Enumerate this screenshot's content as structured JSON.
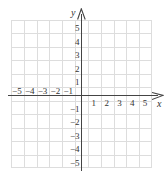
{
  "figure": {
    "kind": "cartesian-coordinate-plane",
    "axis_labels": {
      "x": "x",
      "y": "y"
    },
    "icons": {
      "x_arrow": "arrow-right-icon",
      "y_arrow": "arrow-up-icon"
    },
    "colors": {
      "background": "#ffffff",
      "grid_line": "#dddddd",
      "axis_line": "#444444",
      "label_text": "#333333"
    }
  },
  "chart_data": {
    "type": "scatter",
    "title": "",
    "xlabel": "x",
    "ylabel": "y",
    "xlim": [
      -6,
      6
    ],
    "ylim": [
      -6,
      6
    ],
    "grid": true,
    "legend": null,
    "x_ticks": [
      -5,
      -4,
      -3,
      -2,
      -1,
      1,
      2,
      3,
      4,
      5
    ],
    "y_ticks": [
      5,
      4,
      3,
      2,
      1,
      -1,
      -2,
      -3,
      -4,
      -5
    ],
    "x_tick_labels": [
      "−5",
      "−4",
      "−3",
      "−2",
      "−1",
      "1",
      "2",
      "3",
      "4",
      "5"
    ],
    "y_tick_labels": [
      "5",
      "4",
      "3",
      "2",
      "1",
      "−1",
      "−2",
      "−3",
      "−4",
      "−5"
    ],
    "series": [],
    "annotations": []
  },
  "ticks": {
    "x": [
      {
        "label": "−5",
        "value": -5
      },
      {
        "label": "−4",
        "value": -4
      },
      {
        "label": "−3",
        "value": -3
      },
      {
        "label": "−2",
        "value": -2
      },
      {
        "label": "−1",
        "value": -1
      },
      {
        "label": "1",
        "value": 1
      },
      {
        "label": "2",
        "value": 2
      },
      {
        "label": "3",
        "value": 3
      },
      {
        "label": "4",
        "value": 4
      },
      {
        "label": "5",
        "value": 5
      }
    ],
    "y": [
      {
        "label": "5",
        "value": 5
      },
      {
        "label": "4",
        "value": 4
      },
      {
        "label": "3",
        "value": 3
      },
      {
        "label": "2",
        "value": 2
      },
      {
        "label": "1",
        "value": 1
      },
      {
        "label": "−1",
        "value": -1
      },
      {
        "label": "−2",
        "value": -2
      },
      {
        "label": "−3",
        "value": -3
      },
      {
        "label": "−4",
        "value": -4
      },
      {
        "label": "−5",
        "value": -5
      }
    ]
  }
}
